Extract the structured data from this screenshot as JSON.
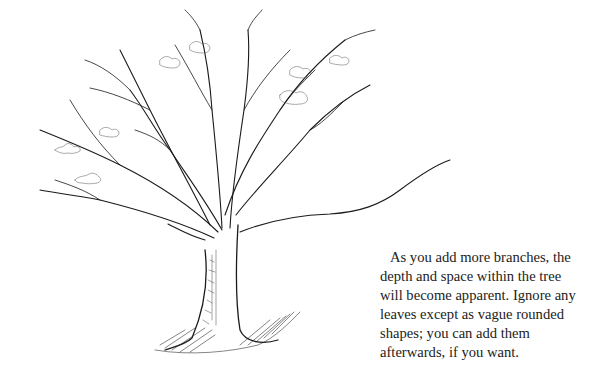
{
  "figure": {
    "icon": "tree-illustration"
  },
  "caption": {
    "lines": [
      "As you add more branches, the",
      "depth and space within the tree",
      "will become apparent. Ignore any",
      "leaves except as vague rounded",
      "shapes; you can add them",
      "afterwards, if you want."
    ],
    "text_color": "#222222"
  }
}
